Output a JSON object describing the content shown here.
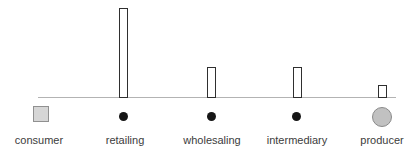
{
  "diagram": {
    "type": "distribution-channel-bar-diagram",
    "columns": [
      {
        "label": "consumer",
        "marker": "square",
        "bar_height_px": 0
      },
      {
        "label": "retailing",
        "marker": "dot",
        "bar_height_px": 90
      },
      {
        "label": "wholesaling",
        "marker": "dot",
        "bar_height_px": 31
      },
      {
        "label": "intermediary",
        "marker": "dot",
        "bar_height_px": 31
      },
      {
        "label": "producer",
        "marker": "circle",
        "bar_height_px": 13
      }
    ],
    "baseline": {
      "color": "#b3b3b3"
    },
    "colors": {
      "bar_fill": "#ffffff",
      "bar_border": "#2f2f2f",
      "square_fill": "#d6d6d6",
      "square_border": "#909090",
      "dot_fill": "#161616",
      "circle_fill": "#c1c1c1",
      "circle_border": "#8a8a8a",
      "label_text": "#3c3c3c"
    }
  },
  "chart_data": {
    "type": "bar",
    "categories": [
      "consumer",
      "retailing",
      "wholesaling",
      "intermediary",
      "producer"
    ],
    "values": [
      0,
      90,
      31,
      31,
      13
    ],
    "title": "",
    "xlabel": "",
    "ylabel": "",
    "note": "no numeric axis shown; values are relative bar heights in pixels"
  }
}
